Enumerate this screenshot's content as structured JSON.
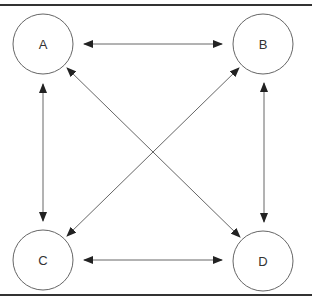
{
  "diagram": {
    "type": "graph",
    "nodes": [
      {
        "id": "A",
        "label": "A",
        "cx": 43,
        "cy": 44
      },
      {
        "id": "B",
        "label": "B",
        "cx": 263,
        "cy": 44
      },
      {
        "id": "C",
        "label": "C",
        "cx": 43,
        "cy": 260
      },
      {
        "id": "D",
        "label": "D",
        "cx": 263,
        "cy": 261
      }
    ],
    "edges": [
      {
        "from": "A",
        "to": "B",
        "bidirectional": true
      },
      {
        "from": "A",
        "to": "C",
        "bidirectional": true
      },
      {
        "from": "A",
        "to": "D",
        "bidirectional": true
      },
      {
        "from": "B",
        "to": "C",
        "bidirectional": true
      },
      {
        "from": "B",
        "to": "D",
        "bidirectional": true
      },
      {
        "from": "C",
        "to": "D",
        "bidirectional": true
      }
    ],
    "colors": {
      "stroke": "#555555",
      "border": "#333333",
      "text": "#333333"
    }
  }
}
